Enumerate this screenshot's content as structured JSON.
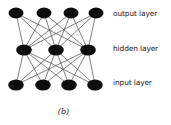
{
  "figure": {
    "caption": "(b)",
    "type": "neural-network-diagram",
    "background_color": "#ffffff",
    "node_color": "#0d0d0d",
    "edge_color": "#3a3a3a"
  },
  "labels": [
    {
      "id": "output",
      "text": "output layer",
      "top": 9
    },
    {
      "id": "hidden",
      "text": "hidden layer",
      "top": 44
    },
    {
      "id": "input",
      "text": "input layer",
      "top": 78
    }
  ],
  "chart_data": {
    "type": "diagram",
    "title": "(b)",
    "layers": [
      {
        "name": "output layer",
        "count": 4,
        "y": 13,
        "nodes": [
          {
            "cx": 16,
            "cy": 13,
            "rx": 7.5,
            "ry": 5.4
          },
          {
            "cx": 44,
            "cy": 13,
            "rx": 7.5,
            "ry": 5.4
          },
          {
            "cx": 71,
            "cy": 13,
            "rx": 7.5,
            "ry": 5.4
          },
          {
            "cx": 96,
            "cy": 13,
            "rx": 7.5,
            "ry": 5.4
          }
        ]
      },
      {
        "name": "hidden layer",
        "count": 3,
        "y": 50,
        "nodes": [
          {
            "cx": 24,
            "cy": 50,
            "rx": 7.8,
            "ry": 5.6
          },
          {
            "cx": 56,
            "cy": 50,
            "rx": 7.8,
            "ry": 5.6
          },
          {
            "cx": 88,
            "cy": 50,
            "rx": 7.8,
            "ry": 5.6
          }
        ]
      },
      {
        "name": "input layer",
        "count": 4,
        "y": 85,
        "nodes": [
          {
            "cx": 16,
            "cy": 85,
            "rx": 7.8,
            "ry": 5.6
          },
          {
            "cx": 43,
            "cy": 85,
            "rx": 7.8,
            "ry": 5.6
          },
          {
            "cx": 69,
            "cy": 85,
            "rx": 7.8,
            "ry": 5.6
          },
          {
            "cx": 95,
            "cy": 85,
            "rx": 7.8,
            "ry": 5.6
          }
        ]
      }
    ],
    "connections": "fully-connected-between-adjacent-layers",
    "edges": [
      {
        "from": [
          24,
          50
        ],
        "to": [
          16,
          13
        ]
      },
      {
        "from": [
          24,
          50
        ],
        "to": [
          44,
          13
        ]
      },
      {
        "from": [
          24,
          50
        ],
        "to": [
          71,
          13
        ]
      },
      {
        "from": [
          24,
          50
        ],
        "to": [
          96,
          13
        ]
      },
      {
        "from": [
          56,
          50
        ],
        "to": [
          16,
          13
        ]
      },
      {
        "from": [
          56,
          50
        ],
        "to": [
          44,
          13
        ]
      },
      {
        "from": [
          56,
          50
        ],
        "to": [
          71,
          13
        ]
      },
      {
        "from": [
          56,
          50
        ],
        "to": [
          96,
          13
        ]
      },
      {
        "from": [
          88,
          50
        ],
        "to": [
          16,
          13
        ]
      },
      {
        "from": [
          88,
          50
        ],
        "to": [
          44,
          13
        ]
      },
      {
        "from": [
          88,
          50
        ],
        "to": [
          71,
          13
        ]
      },
      {
        "from": [
          88,
          50
        ],
        "to": [
          96,
          13
        ]
      },
      {
        "from": [
          16,
          85
        ],
        "to": [
          24,
          50
        ]
      },
      {
        "from": [
          16,
          85
        ],
        "to": [
          56,
          50
        ]
      },
      {
        "from": [
          16,
          85
        ],
        "to": [
          88,
          50
        ]
      },
      {
        "from": [
          43,
          85
        ],
        "to": [
          24,
          50
        ]
      },
      {
        "from": [
          43,
          85
        ],
        "to": [
          56,
          50
        ]
      },
      {
        "from": [
          43,
          85
        ],
        "to": [
          88,
          50
        ]
      },
      {
        "from": [
          69,
          85
        ],
        "to": [
          24,
          50
        ]
      },
      {
        "from": [
          69,
          85
        ],
        "to": [
          56,
          50
        ]
      },
      {
        "from": [
          69,
          85
        ],
        "to": [
          88,
          50
        ]
      },
      {
        "from": [
          95,
          85
        ],
        "to": [
          24,
          50
        ]
      },
      {
        "from": [
          95,
          85
        ],
        "to": [
          56,
          50
        ]
      },
      {
        "from": [
          95,
          85
        ],
        "to": [
          88,
          50
        ]
      }
    ]
  }
}
